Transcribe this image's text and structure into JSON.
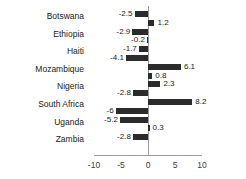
{
  "chart_data": {
    "type": "bar",
    "orientation": "horizontal",
    "title": "",
    "xlabel": "",
    "ylabel": "",
    "xlim": [
      -10,
      10
    ],
    "xticks": [
      -10,
      -5,
      0,
      5,
      10
    ],
    "xtick_labels": [
      "-10",
      "-5",
      "0",
      "5",
      "10"
    ],
    "grid": false,
    "legend": "none",
    "bar_color": "#2b2b2b",
    "axis_color": "#9a9a9a",
    "categories": [
      "Botswana",
      "Ethiopia",
      "Haiti",
      "Mozambique",
      "Nigeria",
      "South Africa",
      "Uganda",
      "Zambia"
    ],
    "series": [
      {
        "name": "series-1",
        "values": [
          -2.5,
          -2.9,
          -1.7,
          6.1,
          2.3,
          8.2,
          -5.2,
          -2.8
        ]
      },
      {
        "name": "series-2",
        "values": [
          1.2,
          -0.2,
          -4.1,
          0.8,
          -2.8,
          -6,
          0.3,
          null
        ]
      }
    ],
    "bars": [
      {
        "category": "Botswana",
        "series": 1,
        "value": -2.5,
        "label": "-2.5"
      },
      {
        "category": "Botswana",
        "series": 2,
        "value": 1.2,
        "label": "1.2"
      },
      {
        "category": "Ethiopia",
        "series": 1,
        "value": -2.9,
        "label": "-2.9"
      },
      {
        "category": "Ethiopia",
        "series": 2,
        "value": -0.2,
        "label": "-0.2"
      },
      {
        "category": "Haiti",
        "series": 1,
        "value": -1.7,
        "label": "-1.7"
      },
      {
        "category": "Haiti",
        "series": 2,
        "value": -4.1,
        "label": "-4.1"
      },
      {
        "category": "Mozambique",
        "series": 1,
        "value": 6.1,
        "label": "6.1"
      },
      {
        "category": "Mozambique",
        "series": 2,
        "value": 0.8,
        "label": "0.8"
      },
      {
        "category": "Nigeria",
        "series": 1,
        "value": 2.3,
        "label": "2.3"
      },
      {
        "category": "Nigeria",
        "series": 2,
        "value": -2.8,
        "label": "-2.8"
      },
      {
        "category": "South Africa",
        "series": 1,
        "value": 8.2,
        "label": "8.2"
      },
      {
        "category": "South Africa",
        "series": 2,
        "value": -6,
        "label": "-6"
      },
      {
        "category": "Uganda",
        "series": 1,
        "value": -5.2,
        "label": "-5.2"
      },
      {
        "category": "Uganda",
        "series": 2,
        "value": 0.3,
        "label": "0.3"
      },
      {
        "category": "Zambia",
        "series": 1,
        "value": -2.8,
        "label": "-2.8"
      }
    ]
  }
}
